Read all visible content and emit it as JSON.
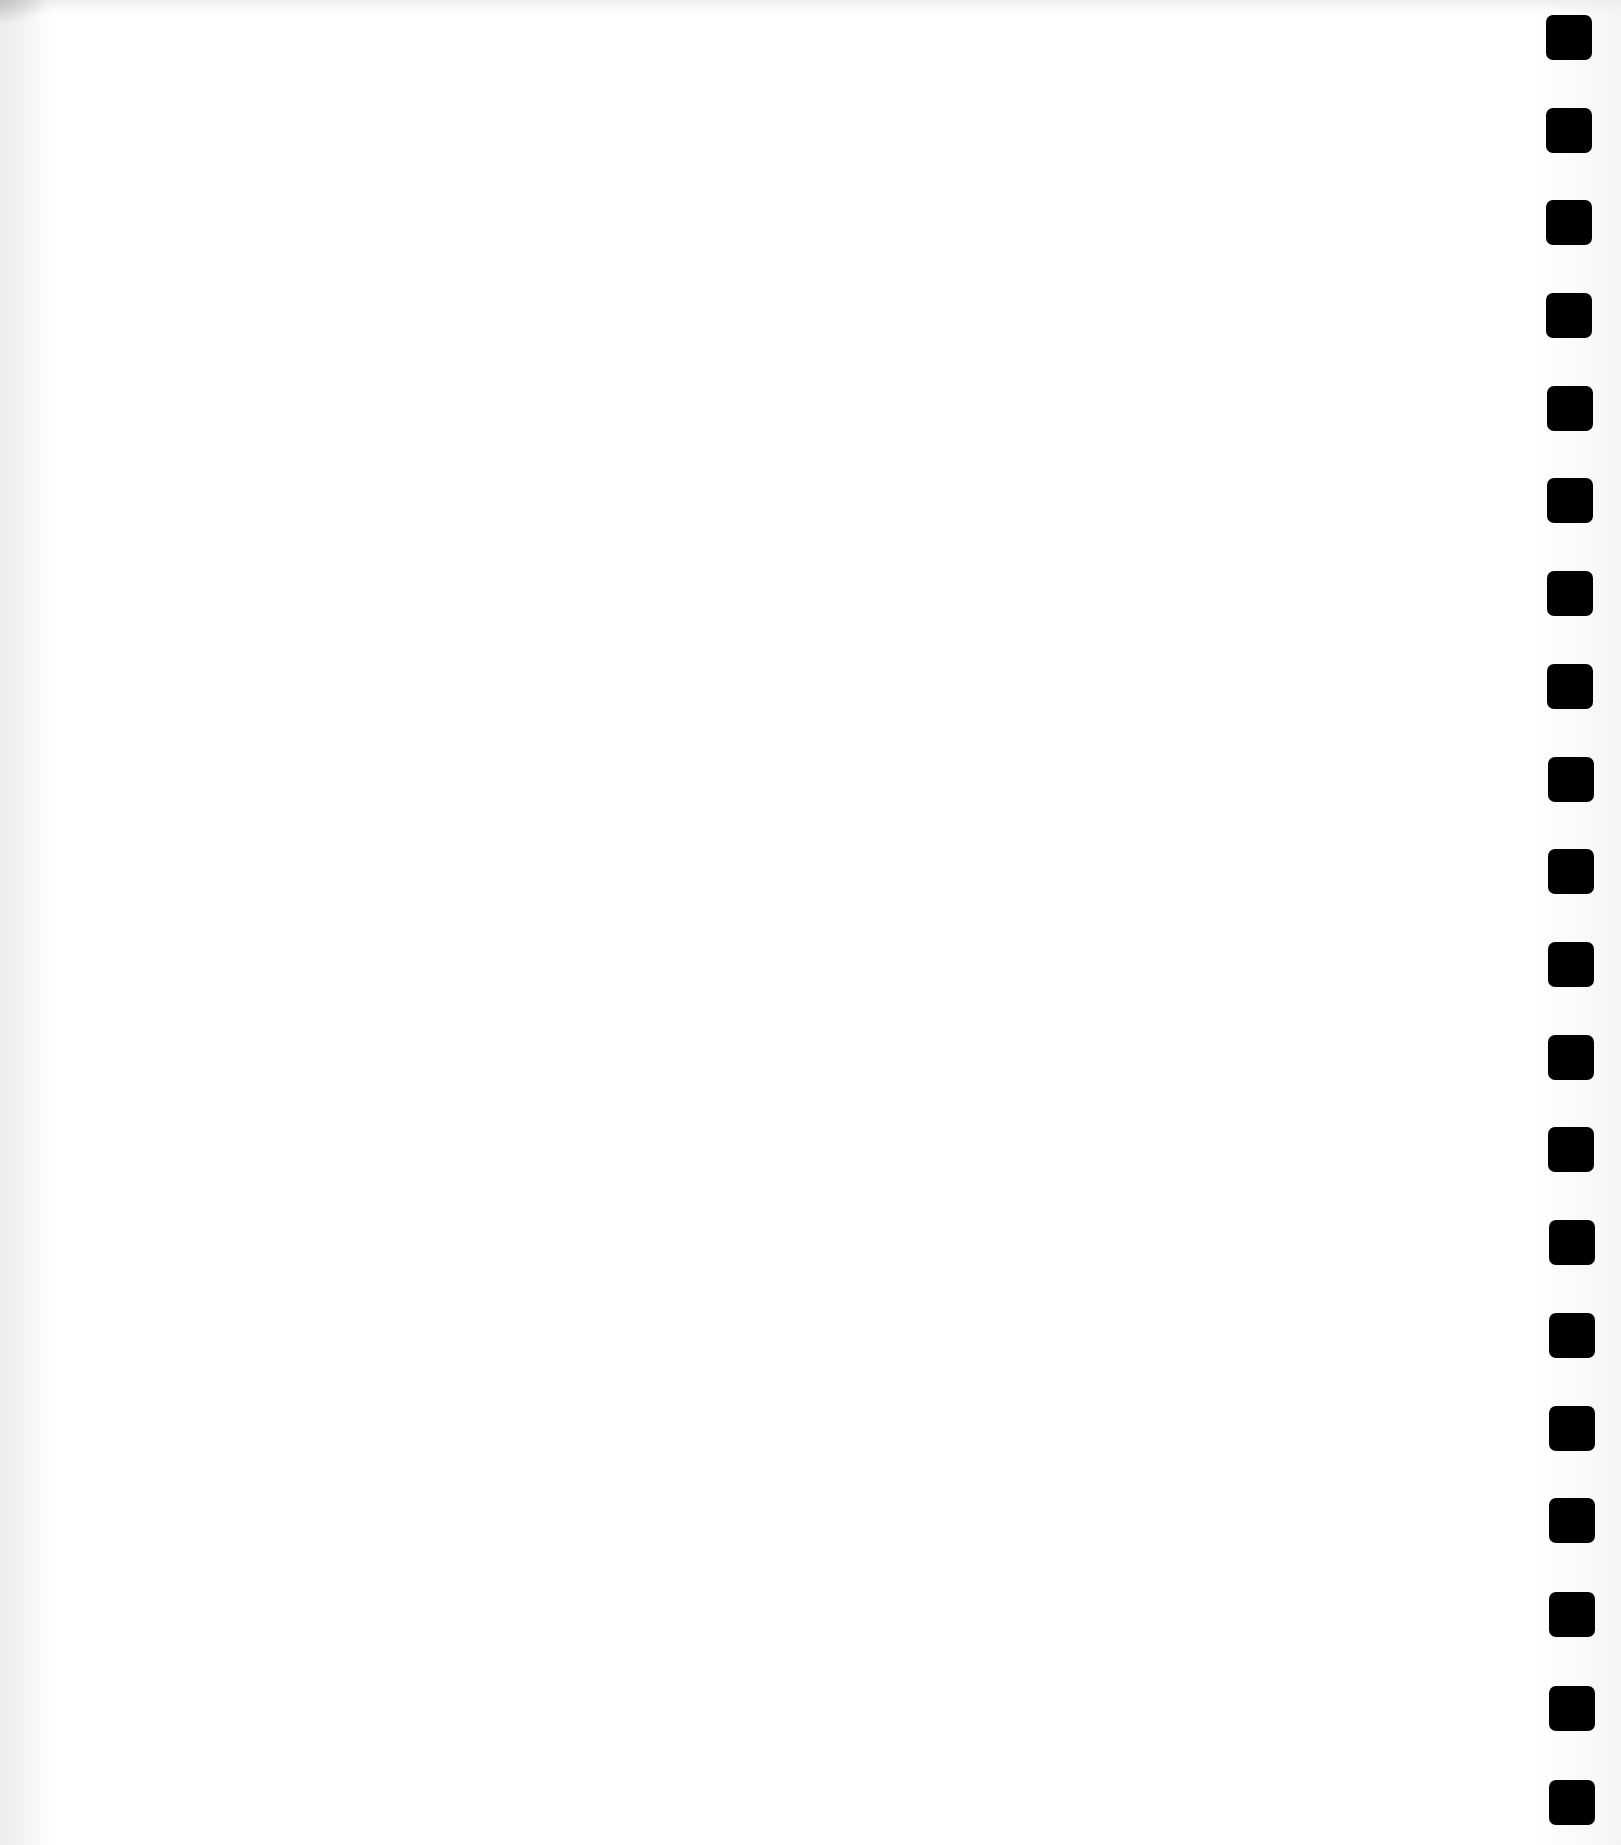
{
  "document": {
    "type": "blank scanned page with spiral-binding punch holes",
    "background_color": "#ffffff",
    "content": ""
  },
  "binding": {
    "side": "right",
    "hole_count": 20,
    "hole_color": "#000000",
    "holes": [
      {
        "x": 1546,
        "y": 15
      },
      {
        "x": 1546,
        "y": 108
      },
      {
        "x": 1546,
        "y": 200
      },
      {
        "x": 1546,
        "y": 293
      },
      {
        "x": 1547,
        "y": 386
      },
      {
        "x": 1547,
        "y": 478
      },
      {
        "x": 1547,
        "y": 571
      },
      {
        "x": 1547,
        "y": 664
      },
      {
        "x": 1548,
        "y": 757
      },
      {
        "x": 1548,
        "y": 849
      },
      {
        "x": 1548,
        "y": 942
      },
      {
        "x": 1548,
        "y": 1035
      },
      {
        "x": 1548,
        "y": 1127
      },
      {
        "x": 1549,
        "y": 1220
      },
      {
        "x": 1549,
        "y": 1313
      },
      {
        "x": 1549,
        "y": 1406
      },
      {
        "x": 1549,
        "y": 1498
      },
      {
        "x": 1549,
        "y": 1592
      },
      {
        "x": 1549,
        "y": 1686
      },
      {
        "x": 1549,
        "y": 1780
      }
    ]
  }
}
